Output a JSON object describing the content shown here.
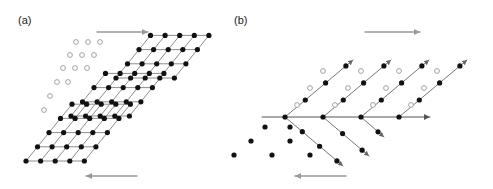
{
  "figure": {
    "width": 493,
    "height": 189,
    "background": "#ffffff",
    "panels": [
      {
        "id": "a",
        "label": "(a)",
        "label_x": 18,
        "label_y": 24
      },
      {
        "id": "b",
        "label": "(b)",
        "label_x": 234,
        "label_y": 24
      }
    ]
  },
  "style": {
    "filled_dot_color": "#111111",
    "open_dot_stroke": "#999999",
    "open_dot_fill": "#ffffff",
    "bond_color": "#808080",
    "ray_color": "#666666",
    "arrow_color": "#999999",
    "axis_color": "#555555",
    "filled_dot_radius": 2.6,
    "open_dot_radius": 2.4,
    "bond_width": 0.9
  },
  "chart_data": {
    "type": "scatter",
    "title": "",
    "xlabel": "",
    "ylabel": "",
    "panel_a": {
      "lattice_vectors": {
        "a_x": 14.6,
        "a_y": 0,
        "b_x": 11.5,
        "b_y": -14.2
      },
      "blocks": [
        {
          "name": "lower-left-block",
          "origin_x": 26,
          "origin_y": 161,
          "cols": 4,
          "rows": 4
        },
        {
          "name": "middle-block",
          "origin_x": 71,
          "origin_y": 116,
          "cols": 4,
          "rows": 3
        },
        {
          "name": "upper-right-block",
          "origin_x": 116,
          "origin_y": 78,
          "cols": 4,
          "rows": 3
        }
      ],
      "open_sites": [
        {
          "x": 44,
          "y": 110
        },
        {
          "x": 50,
          "y": 96
        },
        {
          "x": 57,
          "y": 82
        },
        {
          "x": 68,
          "y": 82
        },
        {
          "x": 63,
          "y": 68
        },
        {
          "x": 75,
          "y": 68
        },
        {
          "x": 87,
          "y": 68
        },
        {
          "x": 70,
          "y": 55
        },
        {
          "x": 82,
          "y": 55
        },
        {
          "x": 94,
          "y": 55
        },
        {
          "x": 76,
          "y": 42
        },
        {
          "x": 88,
          "y": 42
        },
        {
          "x": 100,
          "y": 42
        }
      ],
      "arrows": [
        {
          "name": "top-shear-arrow",
          "direction": "right",
          "x1": 97,
          "y1": 32,
          "x2": 148,
          "y2": 32
        },
        {
          "name": "bottom-shear-arrow",
          "direction": "left",
          "x1": 137,
          "y1": 176,
          "x2": 86,
          "y2": 176
        }
      ]
    },
    "panel_b": {
      "axis": {
        "x1": 262,
        "y1": 117,
        "x2": 430,
        "y2": 117,
        "arrow": "right"
      },
      "vertices": [
        {
          "x": 285,
          "y": 117
        },
        {
          "x": 323,
          "y": 117
        },
        {
          "x": 361,
          "y": 117
        },
        {
          "x": 399,
          "y": 117
        }
      ],
      "upper_rays": [
        {
          "from_x": 285,
          "from_y": 117,
          "to_x": 353,
          "to_y": 60,
          "dots": 3
        },
        {
          "from_x": 323,
          "from_y": 117,
          "to_x": 391,
          "to_y": 60,
          "dots": 3
        },
        {
          "from_x": 361,
          "from_y": 117,
          "to_x": 429,
          "to_y": 60,
          "dots": 3
        },
        {
          "from_x": 399,
          "from_y": 117,
          "to_x": 467,
          "to_y": 60,
          "dots": 3
        }
      ],
      "lower_rays": [
        {
          "from_x": 285,
          "from_y": 117,
          "to_x": 343,
          "to_y": 166,
          "dots": 3
        },
        {
          "from_x": 323,
          "from_y": 117,
          "to_x": 369,
          "to_y": 156,
          "dots": 2
        },
        {
          "from_x": 361,
          "from_y": 117,
          "to_x": 384,
          "to_y": 137,
          "dots": 1
        }
      ],
      "open_sites": [
        {
          "x": 297,
          "y": 105
        },
        {
          "x": 335,
          "y": 105
        },
        {
          "x": 373,
          "y": 105
        },
        {
          "x": 411,
          "y": 105
        },
        {
          "x": 310,
          "y": 88
        },
        {
          "x": 348,
          "y": 88
        },
        {
          "x": 386,
          "y": 88
        },
        {
          "x": 424,
          "y": 88
        },
        {
          "x": 323,
          "y": 71
        },
        {
          "x": 361,
          "y": 71
        },
        {
          "x": 399,
          "y": 71
        },
        {
          "x": 437,
          "y": 71
        }
      ],
      "loose_dots": [
        {
          "x": 265,
          "y": 127
        },
        {
          "x": 290,
          "y": 127
        },
        {
          "x": 251,
          "y": 141
        },
        {
          "x": 290,
          "y": 141
        },
        {
          "x": 234,
          "y": 155
        },
        {
          "x": 272,
          "y": 155
        },
        {
          "x": 310,
          "y": 155
        }
      ],
      "arrows": [
        {
          "name": "top-shear-arrow",
          "direction": "right",
          "x1": 365,
          "y1": 32,
          "x2": 420,
          "y2": 32
        },
        {
          "name": "bottom-shear-arrow",
          "direction": "left",
          "x1": 346,
          "y1": 176,
          "x2": 295,
          "y2": 176
        }
      ]
    }
  }
}
